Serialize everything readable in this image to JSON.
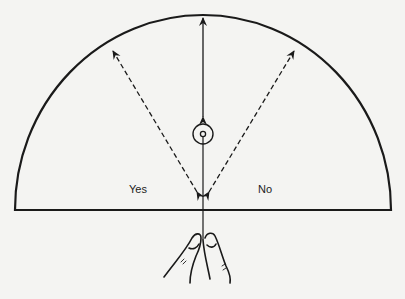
{
  "diagram": {
    "type": "pendulum-dowsing-chart",
    "labels": {
      "yes": "Yes",
      "no": "No"
    },
    "elements": [
      {
        "name": "semicircle-board",
        "description": "Half-circle chart with flat base"
      },
      {
        "name": "vertical-double-arrow",
        "description": "Solid double-headed arrow from pendulum bob to top of arc"
      },
      {
        "name": "dashed-arrow-yes",
        "description": "Dashed diagonal double arrow toward upper-left (Yes swing)"
      },
      {
        "name": "dashed-arrow-no",
        "description": "Dashed diagonal double arrow toward upper-right (No swing)"
      },
      {
        "name": "pendulum-bob",
        "description": "Concentric circle bob on a string"
      },
      {
        "name": "hand-fingers",
        "description": "Thumb and finger holding the pendulum string"
      }
    ],
    "colors": {
      "background": "#f4f4f2",
      "ink": "#1a1a1a"
    }
  }
}
